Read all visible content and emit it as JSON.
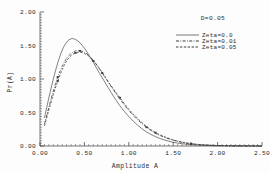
{
  "chart_data": {
    "type": "line",
    "title": "",
    "xlabel": "Amplitude  A",
    "ylabel": "Pr(A)",
    "xlim": [
      0.0,
      2.5
    ],
    "ylim": [
      0.0,
      2.0
    ],
    "xticks": [
      "0.00",
      "0.50",
      "1.00",
      "1.50",
      "2.00",
      "2.50"
    ],
    "xtick_values": [
      0.0,
      0.5,
      1.0,
      1.5,
      2.0,
      2.5
    ],
    "yticks": [
      "0.00",
      "0.50",
      "1.00",
      "1.50",
      "2.00"
    ],
    "ytick_values": [
      0.0,
      0.5,
      1.0,
      1.5,
      2.0
    ],
    "grid": false,
    "legend_position": "top-right",
    "annotations": [
      {
        "text": "D=0.05",
        "x": 1.75,
        "y": 1.82
      }
    ],
    "series": [
      {
        "name": "Zeta=0.0",
        "style": "solid",
        "marker": "none",
        "x": [
          0.05,
          0.1,
          0.15,
          0.2,
          0.25,
          0.3,
          0.35,
          0.4,
          0.45,
          0.5,
          0.55,
          0.6,
          0.65,
          0.7,
          0.8,
          0.9,
          1.0,
          1.1,
          1.2,
          1.3,
          1.4,
          1.5,
          1.6,
          1.7,
          1.8,
          1.9,
          2.0,
          2.2,
          2.5
        ],
        "y": [
          0.42,
          0.72,
          1.0,
          1.24,
          1.43,
          1.55,
          1.6,
          1.59,
          1.54,
          1.46,
          1.36,
          1.25,
          1.13,
          1.02,
          0.8,
          0.6,
          0.44,
          0.31,
          0.21,
          0.14,
          0.09,
          0.055,
          0.034,
          0.02,
          0.012,
          0.007,
          0.004,
          0.002,
          0.0
        ]
      },
      {
        "name": "Zeta=0.01",
        "style": "dash-dot",
        "marker": "tick",
        "x": [
          0.05,
          0.1,
          0.15,
          0.2,
          0.25,
          0.3,
          0.35,
          0.4,
          0.45,
          0.5,
          0.55,
          0.6,
          0.65,
          0.7,
          0.8,
          0.9,
          1.0,
          1.1,
          1.2,
          1.3,
          1.4,
          1.5,
          1.6,
          1.7,
          1.8,
          1.9,
          2.0,
          2.2,
          2.5
        ],
        "y": [
          0.33,
          0.58,
          0.82,
          1.03,
          1.19,
          1.31,
          1.38,
          1.42,
          1.42,
          1.4,
          1.35,
          1.28,
          1.19,
          1.09,
          0.89,
          0.7,
          0.53,
          0.39,
          0.28,
          0.19,
          0.13,
          0.085,
          0.054,
          0.033,
          0.02,
          0.012,
          0.007,
          0.002,
          0.0
        ]
      },
      {
        "name": "Zeta=0.05",
        "style": "dashed",
        "marker": "tick",
        "x": [
          0.05,
          0.1,
          0.15,
          0.2,
          0.25,
          0.3,
          0.35,
          0.4,
          0.45,
          0.5,
          0.55,
          0.6,
          0.65,
          0.7,
          0.8,
          0.9,
          1.0,
          1.1,
          1.2,
          1.3,
          1.4,
          1.5,
          1.6,
          1.7,
          1.8,
          1.9,
          2.0,
          2.2,
          2.5
        ],
        "y": [
          0.3,
          0.54,
          0.77,
          0.97,
          1.14,
          1.27,
          1.35,
          1.39,
          1.4,
          1.38,
          1.34,
          1.27,
          1.19,
          1.1,
          0.9,
          0.72,
          0.55,
          0.41,
          0.29,
          0.2,
          0.14,
          0.092,
          0.058,
          0.036,
          0.022,
          0.013,
          0.008,
          0.003,
          0.0
        ]
      }
    ]
  },
  "legend": {
    "entries": [
      {
        "label": "Zeta=0.0"
      },
      {
        "label": "Zeta=0.01"
      },
      {
        "label": "Zeta=0.05"
      }
    ]
  },
  "annotation": {
    "d_value": "D=0.05"
  },
  "axes": {
    "x_title": "Amplitude  A",
    "y_title": "Pr(A)",
    "x_tick_0": "0.00",
    "x_tick_1": "0.50",
    "x_tick_2": "1.00",
    "x_tick_3": "1.50",
    "x_tick_4": "2.00",
    "x_tick_5": "2.50",
    "y_tick_0": "0.00",
    "y_tick_1": "0.50",
    "y_tick_2": "1.00",
    "y_tick_3": "1.50",
    "y_tick_4": "2.00"
  },
  "colors": {
    "axis": "#3a3a3a",
    "curve": "#3c3c3c",
    "text": "#2b2b2b",
    "background": "#fdfdfd"
  }
}
